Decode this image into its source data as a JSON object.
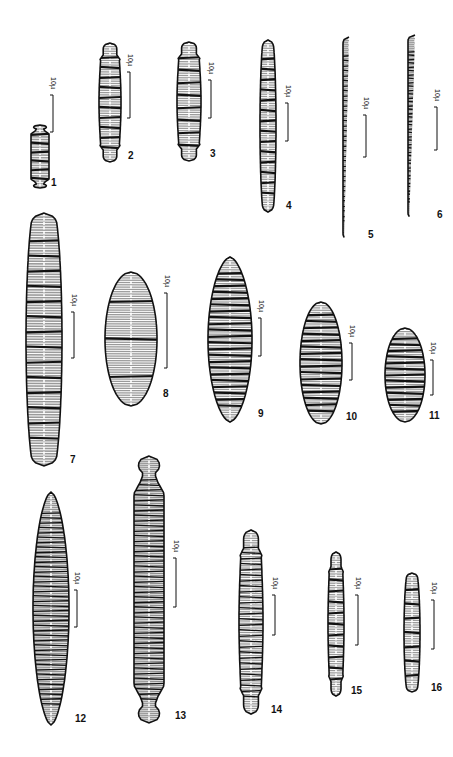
{
  "plate": {
    "background": "#ffffff",
    "ink": "#111111",
    "scale_bar_label": "10µ",
    "figures": [
      {
        "id": "1",
        "label": "1",
        "shape": "capitate",
        "cx": 40,
        "top": 125,
        "bottom": 188,
        "width": 18,
        "bands": 6,
        "striae": "coarse",
        "label_x": 51,
        "label_y": 186,
        "scale": {
          "x": 53,
          "y1": 95,
          "y2": 132
        }
      },
      {
        "id": "2",
        "label": "2",
        "shape": "rostrate",
        "cx": 110,
        "top": 43,
        "bottom": 162,
        "width": 22,
        "bands": 10,
        "striae": "fine",
        "label_x": 128,
        "label_y": 159,
        "scale": {
          "x": 130,
          "y1": 72,
          "y2": 118
        }
      },
      {
        "id": "3",
        "label": "3",
        "shape": "rostrate",
        "cx": 189,
        "top": 42,
        "bottom": 161,
        "width": 24,
        "bands": 8,
        "striae": "fine",
        "label_x": 210,
        "label_y": 157,
        "scale": {
          "x": 211,
          "y1": 80,
          "y2": 118
        }
      },
      {
        "id": "4",
        "label": "4",
        "shape": "tapered",
        "cx": 268,
        "top": 40,
        "bottom": 212,
        "width": 16,
        "bands": 14,
        "striae": "fine",
        "label_x": 286,
        "label_y": 209,
        "scale": {
          "x": 288,
          "y1": 103,
          "y2": 141
        }
      },
      {
        "id": "5",
        "label": "5",
        "shape": "linear",
        "cx": 349,
        "top": 37,
        "bottom": 240,
        "width": 12,
        "bands": 34,
        "striae": "dense",
        "label_x": 368,
        "label_y": 238,
        "scale": {
          "x": 366,
          "y1": 115,
          "y2": 157
        }
      },
      {
        "id": "6",
        "label": "6",
        "shape": "linear",
        "cx": 415,
        "top": 35,
        "bottom": 219,
        "width": 14,
        "bands": 40,
        "striae": "dense",
        "label_x": 437,
        "label_y": 218,
        "scale": {
          "x": 437,
          "y1": 107,
          "y2": 150
        }
      },
      {
        "id": "7",
        "label": "7",
        "shape": "tapered",
        "cx": 44,
        "top": 213,
        "bottom": 466,
        "width": 36,
        "bands": 14,
        "striae": "coarse",
        "label_x": 70,
        "label_y": 463,
        "scale": {
          "x": 74,
          "y1": 312,
          "y2": 358
        }
      },
      {
        "id": "8",
        "label": "8",
        "shape": "elliptic",
        "cx": 131,
        "top": 272,
        "bottom": 406,
        "width": 52,
        "bands": 3,
        "striae": "fine",
        "label_x": 163,
        "label_y": 397,
        "scale": {
          "x": 167,
          "y1": 293,
          "y2": 368
        }
      },
      {
        "id": "9",
        "label": "9",
        "shape": "lanceolate",
        "cx": 230,
        "top": 257,
        "bottom": 422,
        "width": 44,
        "bands": 22,
        "striae": "fine",
        "label_x": 258,
        "label_y": 417,
        "scale": {
          "x": 261,
          "y1": 318,
          "y2": 356
        }
      },
      {
        "id": "10",
        "label": "10",
        "shape": "elliptic",
        "cx": 321,
        "top": 302,
        "bottom": 424,
        "width": 42,
        "bands": 16,
        "striae": "fine",
        "label_x": 346,
        "label_y": 420,
        "scale": {
          "x": 352,
          "y1": 343,
          "y2": 380
        }
      },
      {
        "id": "11",
        "label": "11",
        "shape": "elliptic",
        "cx": 405,
        "top": 328,
        "bottom": 422,
        "width": 40,
        "bands": 13,
        "striae": "fine",
        "label_x": 429,
        "label_y": 419,
        "scale": {
          "x": 433,
          "y1": 360,
          "y2": 395
        }
      },
      {
        "id": "12",
        "label": "12",
        "shape": "lanceolate",
        "cx": 51,
        "top": 492,
        "bottom": 725,
        "width": 36,
        "bands": 40,
        "striae": "dense",
        "label_x": 75,
        "label_y": 722,
        "scale": {
          "x": 77,
          "y1": 590,
          "y2": 627
        }
      },
      {
        "id": "13",
        "label": "13",
        "shape": "capitate",
        "cx": 149,
        "top": 456,
        "bottom": 723,
        "width": 30,
        "bands": 44,
        "striae": "dense",
        "label_x": 175,
        "label_y": 719,
        "scale": {
          "x": 176,
          "y1": 558,
          "y2": 607
        }
      },
      {
        "id": "14",
        "label": "14",
        "shape": "rostrate",
        "cx": 251,
        "top": 530,
        "bottom": 714,
        "width": 24,
        "bands": 28,
        "striae": "fine",
        "label_x": 271,
        "label_y": 713,
        "scale": {
          "x": 275,
          "y1": 595,
          "y2": 635
        }
      },
      {
        "id": "15",
        "label": "15",
        "shape": "rostrate",
        "cx": 336,
        "top": 552,
        "bottom": 696,
        "width": 16,
        "bands": 11,
        "striae": "fine",
        "label_x": 351,
        "label_y": 694,
        "scale": {
          "x": 358,
          "y1": 595,
          "y2": 645
        }
      },
      {
        "id": "16",
        "label": "16",
        "shape": "tapered",
        "cx": 412,
        "top": 573,
        "bottom": 692,
        "width": 16,
        "bands": 7,
        "striae": "fine",
        "label_x": 431,
        "label_y": 691,
        "scale": {
          "x": 434,
          "y1": 600,
          "y2": 649
        }
      }
    ]
  }
}
